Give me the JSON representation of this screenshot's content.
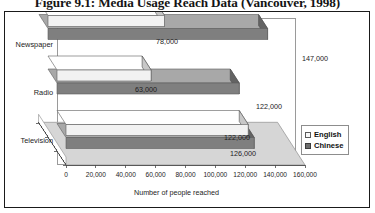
{
  "figure": {
    "caption": "Figure 9.1: Media Usage Reach Data (Vancouver, 1998)"
  },
  "chart_data": {
    "type": "bar",
    "orientation": "horizontal",
    "style": "3d-clustered-bar",
    "title": "",
    "xlabel": "Number of people reached",
    "ylabel": "",
    "categories": [
      "Newspaper",
      "Radio",
      "Television"
    ],
    "series": [
      {
        "name": "English",
        "color": "#f2f2f2",
        "values": [
          78000,
          63000,
          122000
        ],
        "labels": [
          "78,000",
          "63,000",
          "122,000"
        ]
      },
      {
        "name": "Chinese",
        "color": "#808080",
        "values": [
          147000,
          122000,
          126000
        ],
        "labels": [
          "147,000",
          "122,000",
          "126,000"
        ]
      }
    ],
    "xlim": [
      0,
      160000
    ],
    "xticks": [
      0,
      20000,
      40000,
      60000,
      80000,
      100000,
      120000,
      140000,
      160000
    ],
    "xticklabels": [
      "0",
      "20,000",
      "40,000",
      "60,000",
      "80,000",
      "100,000",
      "120,000",
      "140,000",
      "160,000"
    ],
    "grid": false,
    "legend_position": "right"
  },
  "legend": {
    "items": [
      {
        "label": "English",
        "swatch": "#f7f7f7",
        "border": "#5a5a5a"
      },
      {
        "label": "Chinese",
        "swatch": "#6e6e6e",
        "border": "#3d3d3d"
      }
    ]
  },
  "colors": {
    "frame": "#1a1a1a",
    "plot_border": "#9a9a9a",
    "english_face": "#f2f2f2",
    "english_top": "#ffffff",
    "english_side": "#c8c8c8",
    "chinese_face": "#7f7f7f",
    "chinese_top": "#a8a8a8",
    "chinese_side": "#636363",
    "wall": "#ffffff",
    "floor": "#d6d6d6",
    "axis": "#4a4a4a"
  }
}
